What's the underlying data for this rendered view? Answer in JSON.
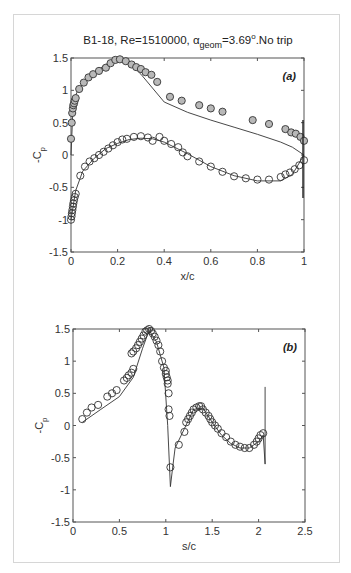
{
  "figure": {
    "title_prefix": "B1-18, Re=1510000, ",
    "title_alpha": "α",
    "title_sub": "geom",
    "title_suffix": "=3.69",
    "title_deg": "o",
    "title_end": ".No trip"
  },
  "chart_data": [
    {
      "type": "scatter",
      "panel": "(a)",
      "title": "B1-18, Re=1510000, α_geom=3.69°.No trip",
      "xlabel": "x/c",
      "ylabel": "-C_p",
      "xlim": [
        0,
        1
      ],
      "ylim": [
        -1.5,
        1.5
      ],
      "xticks": [
        "0",
        "0.2",
        "0.4",
        "0.6",
        "0.8",
        "1"
      ],
      "yticks": [
        "-1.5",
        "-1",
        "-0.5",
        "0",
        "0.5",
        "1",
        "1.5"
      ],
      "grid": false,
      "series": [
        {
          "name": "Experiment upper surface",
          "marker": "circle-filled-grey",
          "x": [
            0.0,
            0.003,
            0.005,
            0.008,
            0.01,
            0.013,
            0.016,
            0.02,
            0.035,
            0.055,
            0.075,
            0.095,
            0.12,
            0.15,
            0.17,
            0.19,
            0.21,
            0.235,
            0.26,
            0.28,
            0.3,
            0.32,
            0.345,
            0.37,
            0.425,
            0.475,
            0.55,
            0.6,
            0.65,
            0.78,
            0.85,
            0.92,
            0.945,
            0.965,
            0.985,
            1.0
          ],
          "y": [
            0.25,
            0.5,
            0.65,
            0.72,
            0.77,
            0.8,
            0.84,
            0.88,
            1.02,
            1.12,
            1.2,
            1.25,
            1.3,
            1.35,
            1.42,
            1.47,
            1.48,
            1.45,
            1.4,
            1.36,
            1.33,
            1.28,
            1.24,
            1.13,
            0.9,
            0.84,
            0.77,
            0.72,
            0.67,
            0.54,
            0.48,
            0.4,
            0.35,
            0.33,
            0.28,
            0.22
          ]
        },
        {
          "name": "Experiment lower surface",
          "marker": "circle-open",
          "x": [
            0.0,
            0.002,
            0.004,
            0.006,
            0.008,
            0.01,
            0.013,
            0.016,
            0.02,
            0.04,
            0.06,
            0.08,
            0.1,
            0.12,
            0.14,
            0.16,
            0.18,
            0.2,
            0.22,
            0.24,
            0.27,
            0.3,
            0.33,
            0.35,
            0.38,
            0.4,
            0.43,
            0.46,
            0.48,
            0.5,
            0.55,
            0.6,
            0.65,
            0.7,
            0.75,
            0.8,
            0.85,
            0.9,
            0.92,
            0.94,
            0.96,
            0.98,
            1.0
          ],
          "y": [
            -1.0,
            -0.95,
            -0.9,
            -0.85,
            -0.8,
            -0.75,
            -0.7,
            -0.65,
            -0.6,
            -0.32,
            -0.18,
            -0.1,
            -0.05,
            0.0,
            0.05,
            0.1,
            0.15,
            0.2,
            0.24,
            0.25,
            0.28,
            0.29,
            0.27,
            0.22,
            0.28,
            0.22,
            0.17,
            0.12,
            0.04,
            -0.02,
            -0.1,
            -0.18,
            -0.26,
            -0.33,
            -0.36,
            -0.38,
            -0.38,
            -0.34,
            -0.3,
            -0.27,
            -0.22,
            -0.16,
            -0.08
          ]
        },
        {
          "name": "Computation",
          "marker": "line",
          "x": [
            0.0,
            0.01,
            0.03,
            0.06,
            0.1,
            0.15,
            0.2,
            0.24,
            0.3,
            0.4,
            0.5,
            0.6,
            0.7,
            0.8,
            0.9,
            0.95,
            1.0
          ],
          "y": [
            0.0,
            0.85,
            1.0,
            1.15,
            1.28,
            1.4,
            1.48,
            1.46,
            1.25,
            0.82,
            0.66,
            0.54,
            0.43,
            0.32,
            0.2,
            0.12,
            0.0
          ]
        },
        {
          "name": "Computation lower",
          "marker": "line",
          "x": [
            0.0,
            0.02,
            0.05,
            0.1,
            0.15,
            0.2,
            0.25,
            0.3,
            0.35,
            0.4,
            0.5,
            0.6,
            0.7,
            0.8,
            0.9,
            0.95,
            1.0
          ],
          "y": [
            -1.0,
            -0.55,
            -0.25,
            -0.05,
            0.1,
            0.18,
            0.24,
            0.26,
            0.25,
            0.2,
            0.02,
            -0.18,
            -0.32,
            -0.4,
            -0.4,
            -0.3,
            0.0
          ]
        }
      ],
      "annotations": [
        "(a)"
      ]
    },
    {
      "type": "scatter",
      "panel": "(b)",
      "xlabel": "s/c",
      "ylabel": "-C_p",
      "xlim": [
        0,
        2.5
      ],
      "ylim": [
        -1.5,
        1.5
      ],
      "xticks": [
        "0",
        "0.5",
        "1",
        "1.5",
        "2",
        "2.5"
      ],
      "yticks": [
        "-1.5",
        "-1",
        "-0.5",
        "0",
        "0.5",
        "1",
        "1.5"
      ],
      "grid": false,
      "series": [
        {
          "name": "Experiment",
          "marker": "circle-open",
          "x": [
            0.1,
            0.15,
            0.2,
            0.27,
            0.37,
            0.42,
            0.47,
            0.55,
            0.58,
            0.6,
            0.63,
            0.65,
            0.63,
            0.65,
            0.68,
            0.7,
            0.72,
            0.74,
            0.76,
            0.78,
            0.8,
            0.82,
            0.84,
            0.86,
            0.88,
            0.9,
            0.92,
            0.94,
            0.96,
            0.98,
            1.0,
            1.0,
            1.01,
            1.02,
            1.02,
            1.03,
            1.03,
            1.04,
            1.05,
            1.14,
            1.2,
            1.22,
            1.24,
            1.26,
            1.28,
            1.3,
            1.33,
            1.36,
            1.38,
            1.4,
            1.43,
            1.46,
            1.48,
            1.5,
            1.53,
            1.56,
            1.6,
            1.65,
            1.7,
            1.75,
            1.8,
            1.85,
            1.9,
            1.95,
            1.98,
            2.0,
            2.02,
            2.05
          ],
          "y": [
            0.1,
            0.2,
            0.28,
            0.32,
            0.45,
            0.5,
            0.55,
            0.7,
            0.74,
            0.78,
            0.82,
            0.88,
            1.12,
            1.15,
            1.2,
            1.25,
            1.3,
            1.35,
            1.4,
            1.46,
            1.48,
            1.5,
            1.47,
            1.43,
            1.38,
            1.32,
            1.25,
            1.15,
            1.0,
            0.9,
            0.85,
            0.8,
            0.75,
            0.7,
            0.65,
            0.5,
            0.25,
            0.15,
            -0.65,
            -0.3,
            -0.1,
            0.05,
            0.1,
            0.15,
            0.2,
            0.25,
            0.28,
            0.3,
            0.3,
            0.25,
            0.2,
            0.15,
            0.1,
            0.05,
            0.0,
            -0.05,
            -0.12,
            -0.18,
            -0.25,
            -0.3,
            -0.33,
            -0.35,
            -0.35,
            -0.3,
            -0.25,
            -0.2,
            -0.15,
            -0.12
          ]
        },
        {
          "name": "Computation",
          "marker": "line",
          "x": [
            0.1,
            0.3,
            0.5,
            0.65,
            0.75,
            0.82,
            0.9,
            0.98,
            1.02,
            1.05,
            1.07,
            1.1,
            1.2,
            1.3,
            1.4,
            1.5,
            1.6,
            1.7,
            1.8,
            1.9,
            2.0,
            2.05,
            2.07,
            2.07
          ],
          "y": [
            0.05,
            0.25,
            0.45,
            0.75,
            1.2,
            1.48,
            1.3,
            0.9,
            0.0,
            -0.95,
            -0.7,
            -0.35,
            -0.05,
            0.25,
            0.27,
            0.05,
            -0.15,
            -0.28,
            -0.35,
            -0.35,
            -0.25,
            -0.15,
            -0.6,
            0.6
          ]
        }
      ],
      "annotations": [
        "(b)"
      ]
    }
  ]
}
